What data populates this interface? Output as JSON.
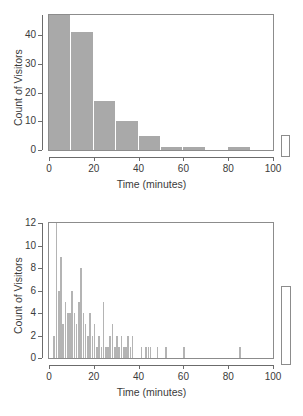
{
  "figure": {
    "background": "#ffffff",
    "bar_color": "#a9a9a9",
    "spike_color": "#b4b4b4",
    "frame_color": "#8c8c8c",
    "text_color": "#3b3b3b"
  },
  "chart_data": [
    {
      "type": "bar",
      "title": "",
      "xlabel": "Time (minutes)",
      "ylabel": "Count of Visitors",
      "xlim": [
        0,
        100
      ],
      "ylim": [
        0,
        47
      ],
      "xticks": [
        0,
        20,
        40,
        60,
        80,
        100
      ],
      "xticklabels": [
        "0",
        "20",
        "40",
        "60",
        "80",
        "100"
      ],
      "yticks": [
        0,
        10,
        20,
        30,
        40
      ],
      "yticklabels": [
        "0",
        "10",
        "20",
        "30",
        "40"
      ],
      "grid": false,
      "legend": null,
      "binwidth": 10,
      "bin_edges": [
        0,
        10,
        20,
        30,
        40,
        50,
        60,
        70,
        80,
        90,
        100
      ],
      "values": [
        47,
        41,
        17,
        10,
        5,
        1,
        1,
        0,
        1,
        0
      ],
      "categories": [
        "0-10",
        "10-20",
        "20-30",
        "30-40",
        "40-50",
        "50-60",
        "60-70",
        "70-80",
        "80-90",
        "90-100"
      ]
    },
    {
      "type": "bar",
      "title": "",
      "xlabel": "Time (minutes)",
      "ylabel": "Count of Visitors",
      "xlim": [
        0,
        100
      ],
      "ylim": [
        0,
        12
      ],
      "xticks": [
        0,
        20,
        40,
        60,
        80,
        100
      ],
      "xticklabels": [
        "0",
        "20",
        "40",
        "60",
        "80",
        "100"
      ],
      "yticks": [
        0,
        2,
        4,
        6,
        8,
        10,
        12
      ],
      "yticklabels": [
        "0",
        "2",
        "4",
        "6",
        "8",
        "10",
        "12"
      ],
      "grid": false,
      "legend": null,
      "binwidth": 1,
      "x": [
        2,
        3,
        4,
        5,
        6,
        7,
        8,
        9,
        10,
        11,
        12,
        13,
        14,
        15,
        16,
        17,
        18,
        19,
        20,
        21,
        22,
        23,
        24,
        25,
        26,
        27,
        28,
        29,
        30,
        31,
        32,
        33,
        34,
        35,
        36,
        37,
        38,
        39,
        40,
        41,
        42,
        43,
        44,
        45,
        46,
        47,
        48,
        49,
        50,
        51,
        52,
        53,
        54,
        55,
        56,
        57,
        58,
        59,
        60,
        61,
        62,
        63,
        64,
        65,
        66,
        67,
        68,
        69,
        70,
        71,
        72,
        73,
        74,
        75,
        76,
        77,
        78,
        79,
        80,
        81,
        82,
        83,
        84,
        85,
        86,
        87,
        88,
        89,
        90
      ],
      "values": [
        2,
        12,
        6,
        9,
        3,
        5,
        4,
        4,
        6,
        4,
        3,
        5,
        8,
        4,
        3,
        2,
        4,
        2,
        3,
        1,
        2,
        1,
        5,
        1,
        1,
        2,
        3,
        1,
        2,
        1,
        2,
        1,
        1,
        2,
        1,
        2,
        0,
        0,
        0,
        1,
        0,
        1,
        1,
        1,
        0,
        0,
        1,
        0,
        0,
        0,
        1,
        0,
        0,
        0,
        0,
        0,
        0,
        0,
        1,
        0,
        0,
        0,
        0,
        0,
        0,
        0,
        0,
        0,
        0,
        0,
        0,
        0,
        0,
        0,
        0,
        0,
        0,
        0,
        0,
        0,
        0,
        0,
        0,
        1,
        0,
        0,
        0,
        0,
        0
      ]
    }
  ]
}
